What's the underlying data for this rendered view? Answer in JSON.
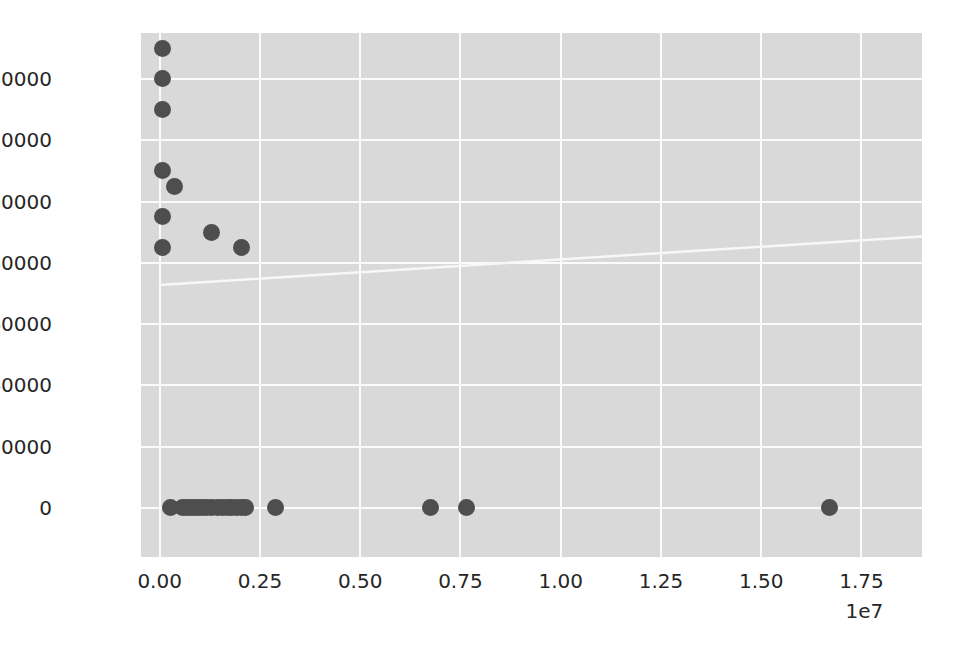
{
  "figure": {
    "background_color": "#ffffff",
    "plot_background_color": "#d9d9d9",
    "grid_color": "#fbfbfb",
    "point_color": "#4e4e4e",
    "trendline_color": "#f7f7f7"
  },
  "chart_data": {
    "type": "scatter",
    "title": "",
    "xlabel": "",
    "ylabel": "",
    "xlim": [
      -465000.0,
      19010000.0
    ],
    "ylim": [
      -16000,
      155000
    ],
    "grid": true,
    "legend": null,
    "x_offset_label": "1e7",
    "x_tick_labels": [
      "0.00",
      "0.25",
      "0.50",
      "0.75",
      "1.00",
      "1.25",
      "1.50",
      "1.75"
    ],
    "x_tick_values": [
      0,
      2500000,
      5000000,
      7500000,
      10000000,
      12500000,
      15000000,
      17500000
    ],
    "y_tick_labels": [
      "0",
      "20000",
      "40000",
      "60000",
      "80000",
      "100000",
      "120000",
      "140000"
    ],
    "y_tick_values": [
      0,
      20000,
      40000,
      60000,
      80000,
      100000,
      120000,
      140000
    ],
    "points": [
      {
        "x": 60000,
        "y": 150000
      },
      {
        "x": 60000,
        "y": 140000
      },
      {
        "x": 60000,
        "y": 130000
      },
      {
        "x": 60000,
        "y": 110000
      },
      {
        "x": 370000,
        "y": 105000
      },
      {
        "x": 60000,
        "y": 95000
      },
      {
        "x": 1300000,
        "y": 90000
      },
      {
        "x": 60000,
        "y": 85000
      },
      {
        "x": 2050000,
        "y": 85000
      },
      {
        "x": 270000,
        "y": 0
      },
      {
        "x": 560000,
        "y": 0
      },
      {
        "x": 680000,
        "y": 0
      },
      {
        "x": 780000,
        "y": 0
      },
      {
        "x": 880000,
        "y": 0
      },
      {
        "x": 980000,
        "y": 0
      },
      {
        "x": 1080000,
        "y": 0
      },
      {
        "x": 1180000,
        "y": 0
      },
      {
        "x": 1300000,
        "y": 0
      },
      {
        "x": 1450000,
        "y": 0
      },
      {
        "x": 1560000,
        "y": 0
      },
      {
        "x": 1680000,
        "y": 0
      },
      {
        "x": 1800000,
        "y": 0
      },
      {
        "x": 1920000,
        "y": 0
      },
      {
        "x": 2030000,
        "y": 0
      },
      {
        "x": 2140000,
        "y": 0
      },
      {
        "x": 2900000,
        "y": 0
      },
      {
        "x": 6750000,
        "y": 0
      },
      {
        "x": 7650000,
        "y": 0
      },
      {
        "x": 16700000,
        "y": 0
      }
    ],
    "trendline": {
      "visible": true,
      "x_start": 0,
      "y_start": 72800,
      "x_end": 19010000,
      "y_end": 88600
    }
  }
}
